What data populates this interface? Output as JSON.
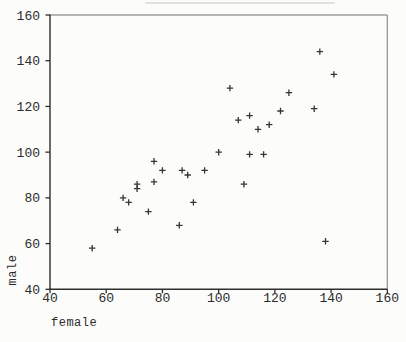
{
  "figure": {
    "background": "#fcfcfa"
  },
  "chart_data": {
    "type": "scatter",
    "title": "",
    "xlabel": "female",
    "ylabel": "male",
    "marker": "plus",
    "grid": false,
    "legend": false,
    "xlim": [
      40,
      160
    ],
    "ylim": [
      40,
      160
    ],
    "xticks": [
      40,
      60,
      80,
      100,
      120,
      140,
      160
    ],
    "yticks": [
      40,
      60,
      80,
      100,
      120,
      140,
      160
    ],
    "points": [
      [
        55,
        58
      ],
      [
        64,
        66
      ],
      [
        66,
        80
      ],
      [
        68,
        78
      ],
      [
        71,
        84
      ],
      [
        71,
        86
      ],
      [
        75,
        74
      ],
      [
        77,
        87
      ],
      [
        77,
        96
      ],
      [
        80,
        92
      ],
      [
        86,
        68
      ],
      [
        87,
        92
      ],
      [
        89,
        90
      ],
      [
        91,
        78
      ],
      [
        95,
        92
      ],
      [
        100,
        100
      ],
      [
        104,
        128
      ],
      [
        107,
        114
      ],
      [
        109,
        86
      ],
      [
        111,
        99
      ],
      [
        111,
        116
      ],
      [
        114,
        110
      ],
      [
        116,
        99
      ],
      [
        118,
        112
      ],
      [
        122,
        118
      ],
      [
        125,
        126
      ],
      [
        134,
        119
      ],
      [
        136,
        144
      ],
      [
        138,
        61
      ],
      [
        141,
        134
      ]
    ],
    "colors": {
      "marker": "#1f1f1f",
      "axis": "#2e2e2e",
      "border_top": "#6f6f6f",
      "border_right": "#8c8c8c",
      "tick_text": "#2b2b2b"
    }
  }
}
